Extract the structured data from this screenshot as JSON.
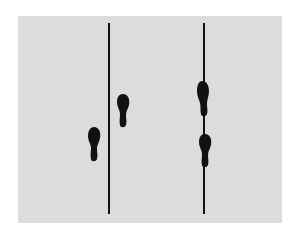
{
  "diagram": {
    "type": "footprint-line-diagram",
    "background_color": "#dcdcdc",
    "ink_color": "#111111",
    "lines": [
      {
        "id": "left-line",
        "x": 109,
        "y1": 23,
        "y2": 214
      },
      {
        "id": "right-line",
        "x": 204,
        "y1": 23,
        "y2": 214
      }
    ],
    "footprints": [
      {
        "id": "left-group-lower",
        "side": "left-of-left-line",
        "cx": 94,
        "cy": 144
      },
      {
        "id": "left-group-upper",
        "side": "right-of-left-line",
        "cx": 123,
        "cy": 110
      },
      {
        "id": "right-group-upper",
        "side": "on-right-line",
        "cx": 203,
        "cy": 98
      },
      {
        "id": "right-group-lower",
        "side": "on-right-line",
        "cx": 205,
        "cy": 150
      }
    ]
  }
}
